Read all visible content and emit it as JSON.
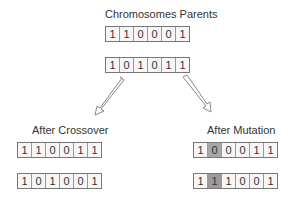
{
  "parents": {
    "title": "Chromosomes Parents",
    "rows": [
      [
        "1",
        "1",
        "0",
        "0",
        "0",
        "1"
      ],
      [
        "1",
        "0",
        "1",
        "0",
        "1",
        "1"
      ]
    ]
  },
  "crossover": {
    "title": "After Crossover",
    "rows": [
      [
        "1",
        "1",
        "0",
        "0",
        "1",
        "1"
      ],
      [
        "1",
        "0",
        "1",
        "0",
        "0",
        "1"
      ]
    ]
  },
  "mutation": {
    "title": "After Mutation",
    "rows": [
      [
        "1",
        "0",
        "0",
        "0",
        "1",
        "1"
      ],
      [
        "1",
        "1",
        "1",
        "0",
        "0",
        "1"
      ]
    ],
    "mutated_cells": [
      [
        0,
        1
      ],
      [
        1,
        1
      ]
    ],
    "mutated_color": "#a0a0a0"
  },
  "arrows": [
    {
      "name": "arrow-to-crossover",
      "direction": "down-left"
    },
    {
      "name": "arrow-to-mutation",
      "direction": "down-right"
    }
  ]
}
